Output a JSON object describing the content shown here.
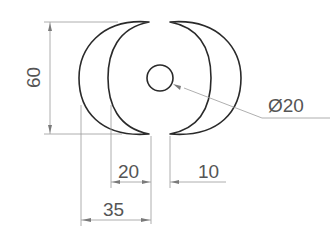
{
  "drawing": {
    "type": "technical-drawing",
    "description": "Two crescent shapes mirrored around a central circle with dimensions",
    "colors": {
      "outline": "#2a2a2a",
      "dimension_line": "#9a9a9a",
      "label_text": "#555555",
      "background": "#ffffff"
    },
    "dimensions": {
      "height": "60",
      "circle_diameter": "Ø20",
      "inner_offset": "20",
      "gap": "10",
      "outer_width": "35"
    }
  }
}
